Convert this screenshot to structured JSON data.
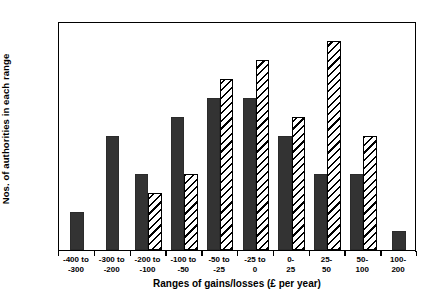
{
  "chart_data": {
    "type": "bar",
    "title": "",
    "xlabel": "Ranges of gains/losses (£ per year)",
    "ylabel": "Nos. of authorities in each range",
    "ylim": [
      0,
      12
    ],
    "yticks": [
      0,
      2,
      4,
      6,
      8,
      10,
      12
    ],
    "grid": false,
    "legend": "none",
    "categories": [
      "-400 to\n-300",
      "-300 to\n-200",
      "-200 to\n-100",
      "-100 to\n-50",
      "-50 to\n-25",
      "-25 to\n0",
      "0-\n25",
      "25-\n50",
      "50-\n100",
      "100-\n200"
    ],
    "series": [
      {
        "name": "solid",
        "style": "solid-dark",
        "color": "#333333",
        "values": [
          2,
          6,
          4,
          7,
          8,
          8,
          6,
          4,
          4,
          1
        ]
      },
      {
        "name": "hatched",
        "style": "diagonal-hatch",
        "color": "#ffffff",
        "values": [
          null,
          null,
          3,
          4,
          9,
          10,
          7,
          11,
          6,
          null
        ]
      }
    ],
    "bar_order_in_group": "solid-then-hatched"
  },
  "axis": {
    "y_title": "Nos. of authorities in each range",
    "x_title": "Ranges of gains/losses (£ per year)",
    "y_tick_labels": [
      "0",
      "2",
      "4",
      "6",
      "8",
      "10",
      "12"
    ],
    "x_tick_labels": [
      "-400 to\n-300",
      "-300 to\n-200",
      "-200 to\n-100",
      "-100 to\n-50",
      "-50 to\n-25",
      "-25 to\n0",
      "0-\n25",
      "25-\n50",
      "50-\n100",
      "100-\n200"
    ]
  }
}
